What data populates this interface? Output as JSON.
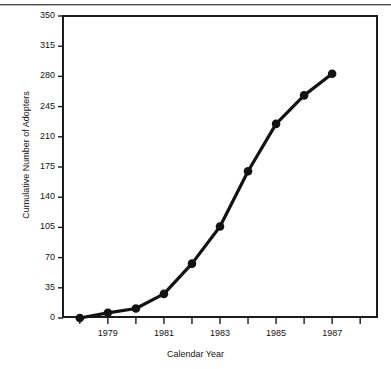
{
  "chart_data": {
    "type": "line",
    "title": "",
    "subtitle": "",
    "xlabel": "Calendar Year",
    "ylabel": "Cumulative Number of Adopters",
    "x": [
      1978,
      1979,
      1980,
      1981,
      1982,
      1983,
      1984,
      1985,
      1986,
      1987
    ],
    "values": [
      0,
      6,
      11,
      28,
      63,
      106,
      170,
      225,
      258,
      283
    ],
    "series": [
      {
        "name": "Cumulative Number of Adopters",
        "values": [
          0,
          6,
          11,
          28,
          63,
          106,
          170,
          225,
          258,
          283
        ]
      }
    ],
    "xlim": [
      1977.4,
      1988.6
    ],
    "ylim": [
      0,
      350
    ],
    "ytick_values": [
      0,
      35,
      70,
      105,
      140,
      175,
      210,
      245,
      280,
      315,
      350
    ],
    "ytick_labels": [
      "0",
      "35",
      "70",
      "105",
      "140",
      "175",
      "210",
      "245",
      "280",
      "315",
      "350"
    ],
    "xtick_values": [
      1978,
      1979,
      1980,
      1981,
      1982,
      1983,
      1984,
      1985,
      1986,
      1987,
      1988
    ],
    "xtick_labels": [
      "",
      "1979",
      "",
      "1981",
      "",
      "1983",
      "",
      "1985",
      "",
      "1987",
      ""
    ],
    "grid": false,
    "legend": null,
    "legend_position": "none",
    "marker": "filled-circle",
    "line_color": "#121212",
    "marker_color": "#121212",
    "background_color": "#ffffff",
    "frame_color": "#1c1c1c",
    "annotations": []
  }
}
